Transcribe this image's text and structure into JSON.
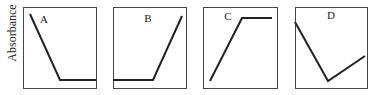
{
  "figure": {
    "ylabel": "Absorbance",
    "line_color": "#222222",
    "frame_color": "#444444",
    "background": "#ffffff"
  },
  "chart_data": {
    "type": "line",
    "title": "",
    "ylabel": "Absorbance",
    "xlabel": "",
    "grid": false,
    "legend": "none",
    "panels": [
      {
        "label": "A",
        "description": "Decreases linearly then plateaus at low value",
        "x": [
          0.1,
          0.5,
          1.0
        ],
        "y": [
          0.9,
          0.1,
          0.1
        ]
      },
      {
        "label": "B",
        "description": "Flat at low value then increases linearly",
        "x": [
          0.0,
          0.55,
          0.95
        ],
        "y": [
          0.1,
          0.1,
          0.9
        ]
      },
      {
        "label": "C",
        "description": "Increases linearly then plateaus at high value",
        "x": [
          0.1,
          0.53,
          0.95
        ],
        "y": [
          0.08,
          0.87,
          0.87
        ]
      },
      {
        "label": "D",
        "description": "Decreases linearly to a minimum then increases",
        "x": [
          0.0,
          0.46,
          0.97
        ],
        "y": [
          0.82,
          0.08,
          0.39
        ]
      }
    ]
  },
  "panels_px": [
    {
      "label": "A",
      "box": [
        23,
        7,
        73,
        81
      ],
      "label_pos": [
        44,
        23
      ],
      "points": "30,14 60,80 96,80"
    },
    {
      "label": "B",
      "box": [
        113,
        7,
        73,
        81
      ],
      "label_pos": [
        148,
        22
      ],
      "points": "113,80 153,80 182,16"
    },
    {
      "label": "C",
      "box": [
        203,
        7,
        74,
        81
      ],
      "label_pos": [
        228,
        20
      ],
      "points": "210,81 242,18 272,18"
    },
    {
      "label": "D",
      "box": [
        295,
        7,
        72,
        81
      ],
      "label_pos": [
        331,
        19
      ],
      "points": "295,22 328,81 365,56"
    }
  ]
}
